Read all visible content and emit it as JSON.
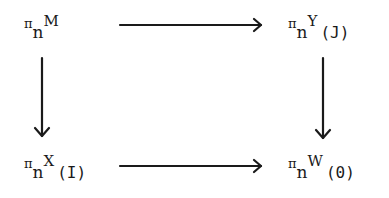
{
  "diagram": {
    "type": "commutative-square",
    "nodes": {
      "top_left": {
        "pi": "π",
        "sub": "n",
        "space": "M",
        "index": ""
      },
      "top_right": {
        "pi": "π",
        "sub": "n",
        "space": "Y",
        "index": "(J)"
      },
      "bottom_left": {
        "pi": "π",
        "sub": "n",
        "space": "X",
        "index": "(I)"
      },
      "bottom_right": {
        "pi": "π",
        "sub": "n",
        "space": "W",
        "index": "(0)"
      }
    },
    "arrows": [
      {
        "from": "top_left",
        "to": "top_right",
        "direction": "right"
      },
      {
        "from": "top_left",
        "to": "bottom_left",
        "direction": "down"
      },
      {
        "from": "top_right",
        "to": "bottom_right",
        "direction": "down"
      },
      {
        "from": "bottom_left",
        "to": "bottom_right",
        "direction": "right"
      }
    ],
    "colors": {
      "ink": "#1a1a1a",
      "background": "#ffffff"
    }
  }
}
